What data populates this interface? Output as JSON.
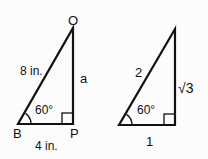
{
  "triangles": [
    {
      "vertices": {
        "top": "O",
        "left": "B",
        "right": "P"
      },
      "hypotenuse": "8 in.",
      "vertical_side": "a",
      "base": "4 in.",
      "angle": "60°"
    },
    {
      "hypotenuse": "2",
      "vertical_side": "√3",
      "base": "1",
      "angle": "60°"
    }
  ],
  "colors": {
    "line": "#111111",
    "background": "#fcfcfc"
  }
}
